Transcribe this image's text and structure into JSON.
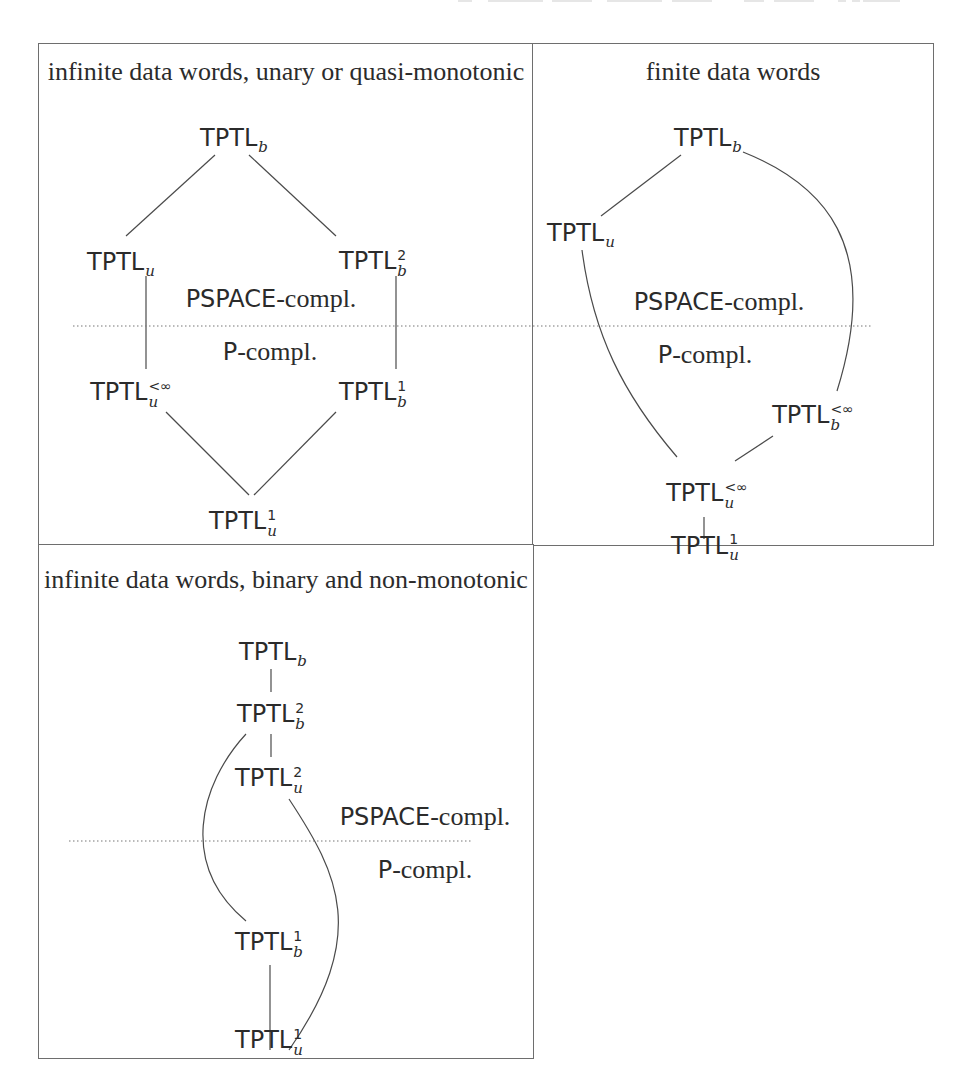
{
  "figure": {
    "panels": [
      {
        "id": "unary",
        "title": "infinite data words, unary or quasi-monotonic",
        "nodes": [
          {
            "id": "TPTLb",
            "base": "TPTL",
            "sub": "b",
            "sup": ""
          },
          {
            "id": "TPTLu",
            "base": "TPTL",
            "sub": "u",
            "sup": ""
          },
          {
            "id": "TPTLb2",
            "base": "TPTL",
            "sub": "b",
            "sup": "2"
          },
          {
            "id": "TPTLuinf",
            "base": "TPTL",
            "sub": "u",
            "sup": "<∞"
          },
          {
            "id": "TPTLb1",
            "base": "TPTL",
            "sub": "b",
            "sup": "1"
          },
          {
            "id": "TPTLu1",
            "base": "TPTL",
            "sub": "u",
            "sup": "1"
          }
        ],
        "edges": [
          [
            "TPTLb",
            "TPTLu"
          ],
          [
            "TPTLb",
            "TPTLb2"
          ],
          [
            "TPTLu",
            "TPTLuinf"
          ],
          [
            "TPTLb2",
            "TPTLb1"
          ],
          [
            "TPTLuinf",
            "TPTLu1"
          ],
          [
            "TPTLb1",
            "TPTLu1"
          ]
        ],
        "upper_class": {
          "cls": "PSPACE",
          "rest": "-compl."
        },
        "lower_class": {
          "cls": "P",
          "rest": "-compl."
        }
      },
      {
        "id": "finite",
        "title": "finite data words",
        "nodes": [
          {
            "id": "TPTLb",
            "base": "TPTL",
            "sub": "b",
            "sup": ""
          },
          {
            "id": "TPTLu",
            "base": "TPTL",
            "sub": "u",
            "sup": ""
          },
          {
            "id": "TPTLbinf",
            "base": "TPTL",
            "sub": "b",
            "sup": "<∞"
          },
          {
            "id": "TPTLuinf",
            "base": "TPTL",
            "sub": "u",
            "sup": "<∞"
          },
          {
            "id": "TPTLu1",
            "base": "TPTL",
            "sub": "u",
            "sup": "1"
          }
        ],
        "edges": [
          [
            "TPTLb",
            "TPTLu"
          ],
          [
            "TPTLb",
            "TPTLbinf"
          ],
          [
            "TPTLu",
            "TPTLuinf"
          ],
          [
            "TPTLbinf",
            "TPTLuinf"
          ],
          [
            "TPTLuinf",
            "TPTLu1"
          ]
        ],
        "upper_class": {
          "cls": "PSPACE",
          "rest": "-compl."
        },
        "lower_class": {
          "cls": "P",
          "rest": "-compl."
        }
      },
      {
        "id": "binary",
        "title": "infinite data words, binary and non-monotonic",
        "nodes": [
          {
            "id": "TPTLb",
            "base": "TPTL",
            "sub": "b",
            "sup": ""
          },
          {
            "id": "TPTLb2",
            "base": "TPTL",
            "sub": "b",
            "sup": "2"
          },
          {
            "id": "TPTLu2",
            "base": "TPTL",
            "sub": "u",
            "sup": "2"
          },
          {
            "id": "TPTLb1",
            "base": "TPTL",
            "sub": "b",
            "sup": "1"
          },
          {
            "id": "TPTLu1",
            "base": "TPTL",
            "sub": "u",
            "sup": "1"
          }
        ],
        "edges": [
          [
            "TPTLb",
            "TPTLb2"
          ],
          [
            "TPTLb2",
            "TPTLu2"
          ],
          [
            "TPTLb2",
            "TPTLb1"
          ],
          [
            "TPTLu2",
            "TPTLu1"
          ],
          [
            "TPTLb1",
            "TPTLu1"
          ]
        ],
        "upper_class": {
          "cls": "PSPACE",
          "rest": "-compl."
        },
        "lower_class": {
          "cls": "P",
          "rest": "-compl."
        }
      }
    ]
  },
  "style": {
    "line_color": "#4a4a4a",
    "border_color": "#6e6e6e",
    "text_color": "#2b2b2b"
  }
}
